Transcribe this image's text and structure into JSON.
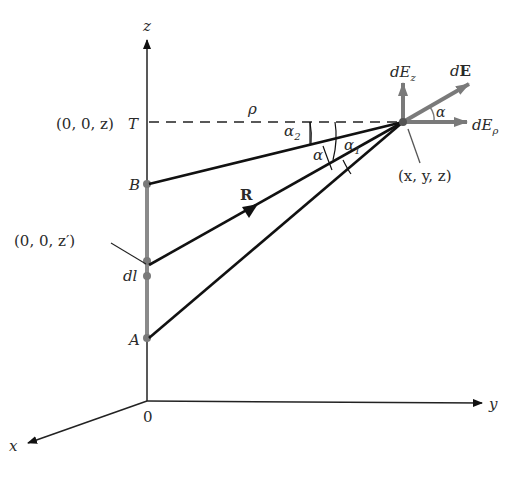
{
  "diagram": {
    "type": "line-charge-field-geometry",
    "axes": {
      "z_label": "z",
      "y_label": "y",
      "x_label": "x",
      "origin_label": "0"
    },
    "points": {
      "T_coord": "(0, 0, z)",
      "T_label": "T",
      "B_label": "B",
      "A_label": "A",
      "source_coord": "(0, 0, z′)",
      "dl_label": "dl",
      "field_point_coord": "(x, y, z)"
    },
    "labels": {
      "rho": "ρ",
      "R": "R",
      "alpha": "α",
      "alpha1_base": "α",
      "alpha1_sub": "1",
      "alpha2_base": "α",
      "alpha2_sub": "2",
      "alpha_field": "α"
    },
    "field_components": {
      "dEz_base": "dE",
      "dEz_sub": "z",
      "dE": "dE",
      "dErho_base": "dE",
      "dErho_sub": "ρ"
    },
    "colors": {
      "ink": "#111111",
      "gray_component": "#7a7a7a",
      "line_charge": "#8a8a8a",
      "text": "#2a2a2a"
    }
  }
}
